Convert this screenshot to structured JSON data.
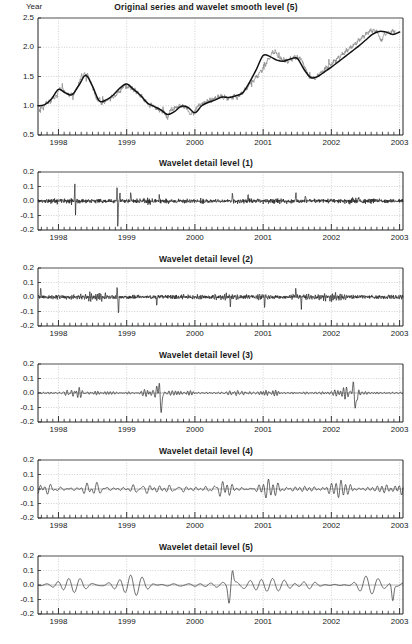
{
  "figure": {
    "corner_label": "Year",
    "background_color": "#ffffff",
    "raw_series_color": "#8e8e8e",
    "smooth_series_color": "#111111",
    "detail_series_color": "#1a1a1a",
    "grid_color": "#bdbdbd"
  },
  "chart_data": [
    {
      "type": "line",
      "title": "Original series and wavelet smooth level (5)",
      "xlabel": "Year",
      "ylabel": "",
      "xlim": [
        1997.7,
        2003.05
      ],
      "ylim": [
        0.5,
        2.5
      ],
      "grid": true,
      "legend": "none",
      "xtick_labels": [
        "1998",
        "1999",
        "2000",
        "2001",
        "2002",
        "2003"
      ],
      "xtick_values": [
        1998,
        1999,
        2000,
        2001,
        2002,
        2003
      ],
      "minor_xticks_per_year": 12,
      "ytick_labels": [
        "0.5",
        "1.0",
        "1.5",
        "2.0",
        "2.5"
      ],
      "ytick_values": [
        0.5,
        1.0,
        1.5,
        2.0,
        2.5
      ],
      "series": [
        {
          "name": "Original series",
          "color": "#8e8e8e",
          "x": [
            1997.7,
            1997.72,
            1997.74,
            1997.76,
            1997.78,
            1997.8,
            1997.82,
            1997.84,
            1997.86,
            1997.88,
            1997.9,
            1997.92,
            1997.94,
            1997.96,
            1997.98,
            1998.0,
            1998.02,
            1998.04,
            1998.06,
            1998.08,
            1998.1,
            1998.12,
            1998.14,
            1998.16,
            1998.18,
            1998.2,
            1998.22,
            1998.24,
            1998.26,
            1998.28,
            1998.3,
            1998.32,
            1998.34,
            1998.36,
            1998.38,
            1998.4,
            1998.42,
            1998.44,
            1998.46,
            1998.48,
            1998.5,
            1998.52,
            1998.54,
            1998.56,
            1998.58,
            1998.6,
            1998.62,
            1998.64,
            1998.66,
            1998.68,
            1998.7,
            1998.72,
            1998.74,
            1998.76,
            1998.78,
            1998.8,
            1998.82,
            1998.84,
            1998.86,
            1998.88,
            1998.9,
            1998.92,
            1998.94,
            1998.96,
            1998.98,
            1999.0,
            1999.02,
            1999.04,
            1999.06,
            1999.08,
            1999.1,
            1999.12,
            1999.14,
            1999.16,
            1999.18,
            1999.2,
            1999.22,
            1999.24,
            1999.26,
            1999.28,
            1999.3,
            1999.32,
            1999.34,
            1999.36,
            1999.38,
            1999.4,
            1999.42,
            1999.44,
            1999.46,
            1999.48,
            1999.5,
            1999.52,
            1999.54,
            1999.56,
            1999.58,
            1999.6,
            1999.62,
            1999.64,
            1999.66,
            1999.68,
            1999.7,
            1999.72,
            1999.74,
            1999.76,
            1999.78,
            1999.8,
            1999.82,
            1999.84,
            1999.86,
            1999.88,
            1999.9,
            1999.92,
            1999.94,
            1999.96,
            1999.98,
            2000.0,
            2000.02,
            2000.04,
            2000.06,
            2000.08,
            2000.1,
            2000.12,
            2000.14,
            2000.16,
            2000.18,
            2000.2,
            2000.22,
            2000.24,
            2000.26,
            2000.28,
            2000.3,
            2000.32,
            2000.34,
            2000.36,
            2000.38,
            2000.4,
            2000.42,
            2000.44,
            2000.46,
            2000.48,
            2000.5,
            2000.52,
            2000.54,
            2000.56,
            2000.58,
            2000.6,
            2000.62,
            2000.64,
            2000.66,
            2000.68,
            2000.7,
            2000.72,
            2000.74,
            2000.76,
            2000.78,
            2000.8,
            2000.82,
            2000.84,
            2000.86,
            2000.88,
            2000.9,
            2000.92,
            2000.94,
            2000.96,
            2000.98,
            2001.0,
            2001.02,
            2001.04,
            2001.06,
            2001.08,
            2001.1,
            2001.12,
            2001.14,
            2001.16,
            2001.18,
            2001.2,
            2001.22,
            2001.24,
            2001.26,
            2001.28,
            2001.3,
            2001.32,
            2001.34,
            2001.36,
            2001.38,
            2001.4,
            2001.42,
            2001.44,
            2001.46,
            2001.48,
            2001.5,
            2001.52,
            2001.54,
            2001.56,
            2001.58,
            2001.6,
            2001.62,
            2001.64,
            2001.66,
            2001.68,
            2001.7,
            2001.72,
            2001.74,
            2001.76,
            2001.78,
            2001.8,
            2001.82,
            2001.84,
            2001.86,
            2001.88,
            2001.9,
            2001.92,
            2001.94,
            2001.96,
            2001.98,
            2002.0,
            2002.02,
            2002.04,
            2002.06,
            2002.08,
            2002.1,
            2002.12,
            2002.14,
            2002.16,
            2002.18,
            2002.2,
            2002.22,
            2002.24,
            2002.26,
            2002.28,
            2002.3,
            2002.32,
            2002.34,
            2002.36,
            2002.38,
            2002.4,
            2002.42,
            2002.44,
            2002.46,
            2002.48,
            2002.5,
            2002.52,
            2002.54,
            2002.56,
            2002.58,
            2002.6,
            2002.62,
            2002.64,
            2002.66,
            2002.68,
            2002.7,
            2002.72,
            2002.74,
            2002.76,
            2002.78,
            2002.8,
            2002.82,
            2002.84,
            2002.86,
            2002.88,
            2002.9,
            2002.92,
            2002.94,
            2002.96,
            2002.98,
            2003.0
          ],
          "y": [
            1.02,
            0.91,
            0.96,
            1.0,
            0.95,
            1.03,
            1.06,
            1.02,
            1.08,
            1.05,
            1.11,
            1.14,
            1.1,
            1.17,
            1.21,
            1.26,
            1.3,
            1.27,
            1.31,
            1.25,
            1.22,
            1.19,
            1.21,
            1.16,
            1.19,
            1.22,
            1.18,
            1.24,
            1.28,
            1.33,
            1.39,
            1.45,
            1.53,
            1.48,
            1.56,
            1.51,
            1.54,
            1.5,
            1.44,
            1.38,
            1.31,
            1.24,
            1.18,
            1.12,
            1.08,
            1.14,
            1.06,
            1.02,
            1.09,
            1.05,
            1.12,
            1.08,
            1.14,
            1.1,
            1.16,
            1.13,
            1.19,
            1.16,
            1.22,
            1.25,
            1.21,
            1.28,
            1.31,
            1.35,
            1.39,
            1.3,
            1.33,
            1.36,
            1.28,
            1.31,
            1.25,
            1.28,
            1.22,
            1.25,
            1.19,
            1.15,
            1.18,
            1.12,
            1.08,
            1.11,
            1.05,
            1.02,
            0.99,
            1.03,
            0.97,
            1.0,
            0.96,
            0.93,
            0.97,
            0.91,
            0.94,
            0.88,
            0.92,
            0.86,
            0.82,
            0.78,
            0.86,
            0.92,
            0.95,
            0.91,
            0.96,
            0.99,
            0.95,
            0.99,
            1.02,
            0.98,
            1.01,
            0.96,
            0.99,
            0.95,
            0.92,
            0.88,
            0.85,
            0.89,
            0.86,
            0.92,
            0.96,
            0.99,
            1.03,
            1.0,
            1.05,
            1.02,
            1.07,
            1.04,
            1.09,
            1.06,
            1.11,
            1.08,
            1.13,
            1.1,
            1.15,
            1.12,
            1.17,
            1.14,
            1.19,
            1.16,
            1.13,
            1.17,
            1.14,
            1.1,
            1.13,
            1.16,
            1.12,
            1.16,
            1.19,
            1.15,
            1.12,
            1.16,
            1.2,
            1.24,
            1.21,
            1.26,
            1.3,
            1.28,
            1.34,
            1.41,
            1.38,
            1.44,
            1.41,
            1.48,
            1.52,
            1.49,
            1.56,
            1.62,
            1.58,
            1.66,
            1.72,
            1.69,
            1.76,
            1.83,
            1.79,
            1.87,
            1.94,
            1.89,
            1.95,
            1.88,
            1.84,
            1.8,
            1.83,
            1.77,
            1.81,
            1.76,
            1.79,
            1.74,
            1.78,
            1.82,
            1.77,
            1.81,
            1.85,
            1.8,
            1.84,
            1.79,
            1.82,
            1.78,
            1.74,
            1.69,
            1.64,
            1.58,
            1.52,
            1.47,
            1.51,
            1.46,
            1.5,
            1.45,
            1.49,
            1.54,
            1.51,
            1.56,
            1.6,
            1.57,
            1.62,
            1.66,
            1.63,
            1.68,
            1.72,
            1.69,
            1.74,
            1.78,
            1.75,
            1.8,
            1.84,
            1.81,
            1.86,
            1.9,
            1.87,
            1.92,
            1.96,
            1.93,
            1.98,
            2.02,
            1.99,
            2.04,
            2.08,
            2.05,
            2.1,
            2.14,
            2.11,
            2.16,
            2.2,
            2.17,
            2.22,
            2.26,
            2.23,
            2.28,
            2.31,
            2.27,
            2.3,
            2.26,
            2.29,
            2.24,
            2.2,
            2.14,
            2.1,
            2.18,
            2.24,
            2.19,
            2.26,
            2.29,
            2.23,
            2.26,
            2.3,
            2.25,
            2.28
          ]
        },
        {
          "name": "Wavelet smooth level (5)",
          "color": "#111111",
          "x": [
            1997.7,
            1997.8,
            1997.9,
            1998.0,
            1998.1,
            1998.2,
            1998.3,
            1998.4,
            1998.5,
            1998.6,
            1998.7,
            1998.8,
            1998.9,
            1999.0,
            1999.1,
            1999.2,
            1999.3,
            1999.4,
            1999.5,
            1999.6,
            1999.7,
            1999.8,
            1999.9,
            2000.0,
            2000.1,
            2000.2,
            2000.3,
            2000.4,
            2000.5,
            2000.6,
            2000.7,
            2000.8,
            2000.9,
            2001.0,
            2001.1,
            2001.2,
            2001.3,
            2001.4,
            2001.5,
            2001.6,
            2001.7,
            2001.8,
            2001.9,
            2002.0,
            2002.1,
            2002.2,
            2002.3,
            2002.4,
            2002.5,
            2002.6,
            2002.7,
            2002.8,
            2002.9,
            2003.0
          ],
          "y": [
            1.0,
            1.02,
            1.12,
            1.28,
            1.22,
            1.19,
            1.35,
            1.52,
            1.33,
            1.08,
            1.1,
            1.18,
            1.3,
            1.37,
            1.28,
            1.18,
            1.05,
            0.99,
            0.93,
            0.85,
            0.9,
            0.99,
            0.97,
            0.88,
            1.0,
            1.06,
            1.1,
            1.15,
            1.14,
            1.17,
            1.22,
            1.4,
            1.62,
            1.86,
            1.84,
            1.78,
            1.76,
            1.8,
            1.81,
            1.62,
            1.48,
            1.5,
            1.58,
            1.66,
            1.75,
            1.84,
            1.93,
            2.02,
            2.12,
            2.22,
            2.27,
            2.26,
            2.22,
            2.26
          ]
        }
      ]
    },
    {
      "type": "line",
      "title": "Wavelet detail level (1)",
      "xlabel": "Year",
      "ylabel": "",
      "xlim": [
        1997.7,
        2003.05
      ],
      "ylim": [
        -0.2,
        0.2
      ],
      "grid": true,
      "legend": "none",
      "xtick_labels": [
        "1998",
        "1999",
        "2000",
        "2001",
        "2002",
        "2003"
      ],
      "xtick_values": [
        1998,
        1999,
        2000,
        2001,
        2002,
        2003
      ],
      "ytick_labels": [
        "-0.2",
        "-0.1",
        "0.0",
        "0.1",
        "0.2"
      ],
      "ytick_values": [
        -0.2,
        -0.1,
        0.0,
        0.1,
        0.2
      ],
      "detail_level": 1,
      "noise_amplitude": 0.016,
      "seed": 11,
      "spikes": [
        {
          "x": 1998.24,
          "y": 0.115
        },
        {
          "x": 1998.25,
          "y": -0.085
        },
        {
          "x": 1998.86,
          "y": 0.1
        },
        {
          "x": 1998.87,
          "y": -0.2
        },
        {
          "x": 1998.9,
          "y": 0.055
        },
        {
          "x": 1999.06,
          "y": 0.055
        },
        {
          "x": 1999.48,
          "y": 0.035
        },
        {
          "x": 2000.55,
          "y": 0.055
        },
        {
          "x": 2000.78,
          "y": 0.04
        },
        {
          "x": 2001.48,
          "y": 0.05
        },
        {
          "x": 2001.62,
          "y": 0.045
        },
        {
          "x": 2002.4,
          "y": 0.035
        }
      ]
    },
    {
      "type": "line",
      "title": "Wavelet detail level (2)",
      "xlabel": "Year",
      "ylabel": "",
      "xlim": [
        1997.7,
        2003.05
      ],
      "ylim": [
        -0.2,
        0.2
      ],
      "grid": true,
      "legend": "none",
      "xtick_labels": [
        "1998",
        "1999",
        "2000",
        "2001",
        "2002",
        "2003"
      ],
      "xtick_values": [
        1998,
        1999,
        2000,
        2001,
        2002,
        2003
      ],
      "ytick_labels": [
        "-0.2",
        "-0.1",
        "0.0",
        "0.1",
        "0.2"
      ],
      "ytick_values": [
        -0.2,
        -0.1,
        0.0,
        0.1,
        0.2
      ],
      "detail_level": 2,
      "noise_amplitude": 0.022,
      "seed": 23,
      "spikes": [
        {
          "x": 1997.74,
          "y": 0.05
        },
        {
          "x": 1998.86,
          "y": 0.075
        },
        {
          "x": 1998.88,
          "y": -0.125
        },
        {
          "x": 1999.44,
          "y": -0.06
        },
        {
          "x": 2000.52,
          "y": -0.065
        },
        {
          "x": 2001.02,
          "y": -0.075
        },
        {
          "x": 2001.48,
          "y": 0.055
        },
        {
          "x": 2001.56,
          "y": -0.07
        }
      ]
    },
    {
      "type": "line",
      "title": "Wavelet detail level (3)",
      "xlabel": "Year",
      "ylabel": "",
      "xlim": [
        1997.7,
        2003.05
      ],
      "ylim": [
        -0.2,
        0.2
      ],
      "grid": true,
      "legend": "none",
      "xtick_labels": [
        "1998",
        "1999",
        "2000",
        "2001",
        "2002",
        "2003"
      ],
      "xtick_values": [
        1998,
        1999,
        2000,
        2001,
        2002,
        2003
      ],
      "ytick_labels": [
        "-0.2",
        "-0.1",
        "0.0",
        "0.1",
        "0.2"
      ],
      "ytick_values": [
        -0.2,
        -0.1,
        0.0,
        0.1,
        0.2
      ],
      "detail_level": 3,
      "noise_amplitude": 0.033,
      "seed": 37,
      "spikes": [
        {
          "x": 1999.48,
          "y": 0.105
        },
        {
          "x": 1999.5,
          "y": -0.155
        },
        {
          "x": 2002.33,
          "y": 0.095
        },
        {
          "x": 2002.35,
          "y": -0.14
        }
      ]
    },
    {
      "type": "line",
      "title": "Wavelet detail level (4)",
      "xlabel": "Year",
      "ylabel": "",
      "xlim": [
        1997.7,
        2003.05
      ],
      "ylim": [
        -0.2,
        0.2
      ],
      "grid": true,
      "legend": "none",
      "xtick_labels": [
        "1998",
        "1999",
        "2000",
        "2001",
        "2002",
        "2003"
      ],
      "xtick_values": [
        1998,
        1999,
        2000,
        2001,
        2002,
        2003
      ],
      "ytick_labels": [
        "-0.2",
        "-0.1",
        "0.0",
        "0.1",
        "0.2"
      ],
      "ytick_values": [
        -0.2,
        -0.1,
        0.0,
        0.1,
        0.2
      ],
      "detail_level": 4,
      "noise_amplitude": 0.042,
      "seed": 53,
      "spikes": []
    },
    {
      "type": "line",
      "title": "Wavelet detail level (5)",
      "xlabel": "Year",
      "ylabel": "",
      "xlim": [
        1997.7,
        2003.05
      ],
      "ylim": [
        -0.2,
        0.2
      ],
      "grid": true,
      "legend": "none",
      "xtick_labels": [
        "1998",
        "1999",
        "2000",
        "2001",
        "2002",
        "2003"
      ],
      "xtick_values": [
        1998,
        1999,
        2000,
        2001,
        2002,
        2003
      ],
      "ytick_labels": [
        "-0.2",
        "-0.1",
        "0.0",
        "0.1",
        "0.2"
      ],
      "ytick_values": [
        -0.2,
        -0.1,
        0.0,
        0.1,
        0.2
      ],
      "detail_level": 5,
      "noise_amplitude": 0.055,
      "seed": 71,
      "spikes": [
        {
          "x": 2000.55,
          "y": 0.1
        },
        {
          "x": 2000.5,
          "y": -0.105
        },
        {
          "x": 2002.9,
          "y": -0.115
        }
      ]
    }
  ]
}
